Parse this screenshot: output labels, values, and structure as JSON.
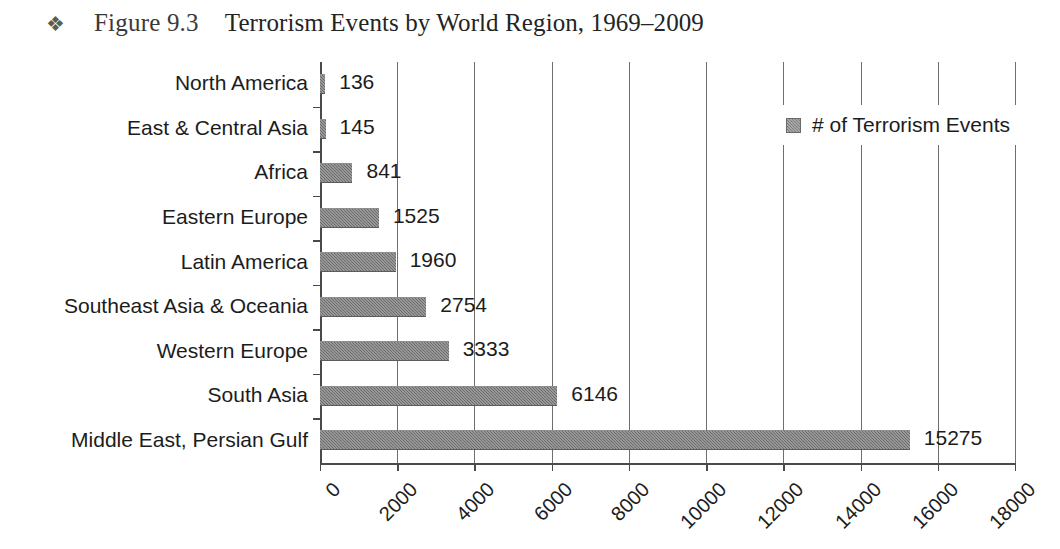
{
  "figure": {
    "bullet_icon": "four-diamond-bullet",
    "bullet_glyph": "❖",
    "number": "Figure 9.3",
    "caption": "Terrorism Events by World Region, 1969–2009"
  },
  "colors": {
    "bar_fill": "#7d7d7d",
    "axis": "#4a4a4a",
    "gridline": "#6e6e6e",
    "text": "#1c1c1c",
    "background": "#ffffff"
  },
  "legend": {
    "position": "top-right",
    "entries": [
      {
        "label": "# of Terrorism Events",
        "color": "#7d7d7d"
      }
    ]
  },
  "chart_data": {
    "type": "bar",
    "orientation": "horizontal",
    "title": "Terrorism Events by World Region, 1969–2009",
    "xlabel": "",
    "ylabel": "",
    "xlim": [
      0,
      18000
    ],
    "xticks": [
      0,
      2000,
      4000,
      6000,
      8000,
      10000,
      12000,
      14000,
      16000,
      18000
    ],
    "xtick_labels": [
      "0",
      "2000",
      "4000",
      "6000",
      "8000",
      "10000",
      "12000",
      "14000",
      "16000",
      "18000"
    ],
    "xtick_rotation": -45,
    "grid": "vertical",
    "legend_position": "top-right",
    "series": [
      {
        "name": "# of Terrorism Events",
        "categories": [
          "North America",
          "East & Central Asia",
          "Africa",
          "Eastern Europe",
          "Latin America",
          "Southeast Asia & Oceania",
          "Western Europe",
          "South Asia",
          "Middle East, Persian Gulf"
        ],
        "values": [
          136,
          145,
          841,
          1525,
          1960,
          2754,
          3333,
          6146,
          15275
        ],
        "value_labels": [
          "136",
          "145",
          "841",
          "1525",
          "1960",
          "2754",
          "3333",
          "6146",
          "15275"
        ]
      }
    ]
  }
}
